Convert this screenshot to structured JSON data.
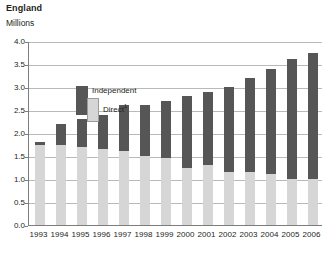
{
  "header": {
    "title": "England",
    "subtitle": "Millions"
  },
  "legend": {
    "independent_label": "Independent",
    "direct_label": "Direct",
    "direct_footnote": "1"
  },
  "chart_data": {
    "type": "bar",
    "stacked": true,
    "title": "England",
    "subtitle": "Millions",
    "xlabel": "",
    "ylabel": "Millions",
    "ylim": [
      0.0,
      4.0
    ],
    "ytick_step": 0.5,
    "grid": true,
    "legend_position": "top-left-inside",
    "categories": [
      "1993",
      "1994",
      "1995",
      "1996",
      "1997",
      "1998",
      "1999",
      "2000",
      "2001",
      "2002",
      "2003",
      "2004",
      "2005",
      "2006"
    ],
    "ytick_labels": [
      "0.0",
      "0.5",
      "1.0",
      "1.5",
      "2.0",
      "2.5",
      "3.0",
      "3.5",
      "4.0"
    ],
    "series": [
      {
        "name": "Direct",
        "color": "#d6d6d6",
        "values": [
          1.75,
          1.75,
          1.7,
          1.65,
          1.6,
          1.5,
          1.45,
          1.25,
          1.3,
          1.15,
          1.15,
          1.1,
          1.0,
          1.0
        ]
      },
      {
        "name": "Independent",
        "color": "#565656",
        "values": [
          0.05,
          0.45,
          0.6,
          0.75,
          1.0,
          1.1,
          1.25,
          1.55,
          1.6,
          1.85,
          2.05,
          2.3,
          2.6,
          2.75
        ]
      }
    ],
    "totals": [
      1.8,
      2.2,
      2.3,
      2.4,
      2.6,
      2.6,
      2.7,
      2.8,
      2.9,
      3.0,
      3.2,
      3.4,
      3.6,
      3.75
    ]
  },
  "colors": {
    "independent": "#565656",
    "direct": "#d6d6d6",
    "gridline": "#b9b9b9",
    "axis": "#7d7d7d",
    "text": "#231f20",
    "background": "#ffffff"
  }
}
